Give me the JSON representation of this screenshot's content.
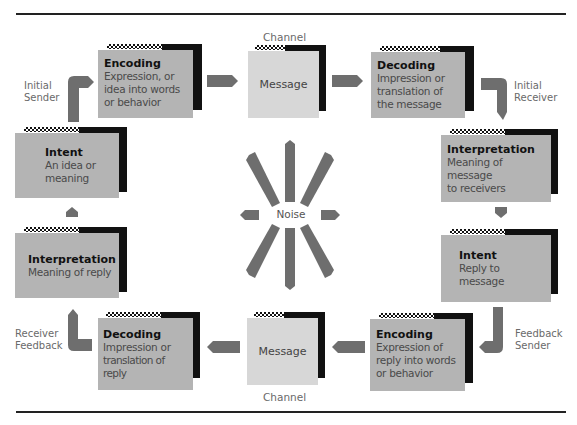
{
  "diagram": {
    "type": "communication-cycle",
    "colors": {
      "box": "#b4b4b4",
      "message_box": "#d7d7d7",
      "shadow": "#111111",
      "arrow": "#6e6e6e",
      "label_text": "#6a6a6a",
      "rule": "#222222"
    },
    "labels": {
      "initial_sender": [
        "Initial",
        "Sender"
      ],
      "initial_receiver": [
        "Initial",
        "Receiver"
      ],
      "feedback_sender": [
        "Feedback",
        "Sender"
      ],
      "receiver_feedback": [
        "Receiver",
        "Feedback"
      ],
      "channel_top": "Channel",
      "channel_bottom": "Channel",
      "noise": "Noise"
    },
    "boxes": {
      "encoding_top": {
        "title": "Encoding",
        "desc": [
          "Expression, or",
          "idea into words",
          "or behavior"
        ]
      },
      "message_top": {
        "title": "Message"
      },
      "decoding_top": {
        "title": "Decoding",
        "desc": [
          "Impression or",
          "translation of",
          "the message"
        ]
      },
      "interpretation_right": {
        "title": "Interpretation",
        "desc": [
          "Meaning of message",
          "to receivers"
        ]
      },
      "intent_right": {
        "title": "Intent",
        "desc": [
          "Reply to message"
        ]
      },
      "encoding_bottom": {
        "title": "Encoding",
        "desc": [
          "Expression of",
          "reply into words",
          "or behavior"
        ]
      },
      "message_bottom": {
        "title": "Message"
      },
      "decoding_bottom": {
        "title": "Decoding",
        "desc": [
          "Impression or",
          "translation of reply"
        ]
      },
      "interpretation_left": {
        "title": "Interpretation",
        "desc": [
          "Meaning of reply"
        ]
      },
      "intent_left": {
        "title": "Intent",
        "desc": [
          "An idea or",
          "meaning"
        ]
      }
    }
  }
}
